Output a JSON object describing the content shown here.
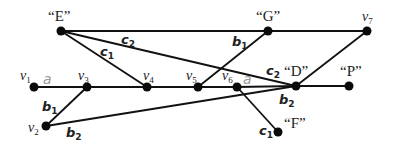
{
  "colors": {
    "edge": "#111111",
    "node": "#0a0a0a",
    "label": "#222222",
    "label_a": "#9a9a9a",
    "background": "#ffffff"
  },
  "nodes": [
    {
      "id": "E",
      "label": "“E”",
      "x": 61,
      "y": 31,
      "lx": 48,
      "ly": 21,
      "kind": "quoted"
    },
    {
      "id": "G",
      "label": "“G”",
      "x": 268,
      "y": 31,
      "lx": 256,
      "ly": 21,
      "kind": "quoted"
    },
    {
      "id": "v7",
      "base": "v",
      "sub": "7",
      "x": 367,
      "y": 31,
      "lx": 362,
      "ly": 21,
      "kind": "v"
    },
    {
      "id": "v1",
      "base": "v",
      "sub": "1",
      "x": 34,
      "y": 87,
      "lx": 20,
      "ly": 80,
      "kind": "v"
    },
    {
      "id": "v3",
      "base": "v",
      "sub": "3",
      "x": 87,
      "y": 87,
      "lx": 78,
      "ly": 80,
      "kind": "v"
    },
    {
      "id": "v4",
      "base": "v",
      "sub": "4",
      "x": 147,
      "y": 87,
      "lx": 143,
      "ly": 80,
      "kind": "v"
    },
    {
      "id": "v5",
      "base": "v",
      "sub": "5",
      "x": 198,
      "y": 87,
      "lx": 186,
      "ly": 80,
      "kind": "v"
    },
    {
      "id": "v6",
      "base": "v",
      "sub": "6",
      "x": 237,
      "y": 87,
      "lx": 222,
      "ly": 80,
      "kind": "v"
    },
    {
      "id": "D",
      "label": "“D”",
      "x": 296,
      "y": 86,
      "lx": 284,
      "ly": 76,
      "kind": "quoted"
    },
    {
      "id": "P",
      "label": "“P”",
      "x": 349,
      "y": 86,
      "lx": 340,
      "ly": 76,
      "kind": "quoted"
    },
    {
      "id": "v2",
      "base": "v",
      "sub": "2",
      "x": 46,
      "y": 126,
      "lx": 28,
      "ly": 132,
      "kind": "v"
    },
    {
      "id": "F",
      "label": "“F”",
      "x": 278,
      "y": 132,
      "lx": 284,
      "ly": 128,
      "kind": "quoted"
    }
  ],
  "edges": [
    {
      "from": "E",
      "to": "G"
    },
    {
      "from": "G",
      "to": "v7"
    },
    {
      "from": "E",
      "to": "D"
    },
    {
      "from": "E",
      "to": "v4"
    },
    {
      "from": "G",
      "to": "v5"
    },
    {
      "from": "v7",
      "to": "D"
    },
    {
      "from": "v1",
      "to": "v3"
    },
    {
      "from": "v3",
      "to": "v4"
    },
    {
      "from": "v4",
      "to": "v5"
    },
    {
      "from": "v5",
      "to": "v6"
    },
    {
      "from": "v6",
      "to": "D"
    },
    {
      "from": "D",
      "to": "P"
    },
    {
      "from": "v3",
      "to": "v2"
    },
    {
      "from": "v2",
      "to": "D"
    },
    {
      "from": "v6",
      "to": "F"
    }
  ],
  "edge_labels": [
    {
      "base": "c",
      "sub": "2",
      "x": 121,
      "y": 44,
      "kind": "bold"
    },
    {
      "base": "c",
      "sub": "1",
      "x": 100,
      "y": 56,
      "kind": "bold"
    },
    {
      "base": "b",
      "sub": "1",
      "x": 232,
      "y": 46,
      "kind": "bold"
    },
    {
      "base": "c",
      "sub": "2",
      "x": 266,
      "y": 75,
      "kind": "bold"
    },
    {
      "base": "a",
      "sub": "",
      "x": 43,
      "y": 84,
      "kind": "gray"
    },
    {
      "base": "a",
      "sub": "",
      "x": 243,
      "y": 84,
      "kind": "gray"
    },
    {
      "base": "b",
      "sub": "1",
      "x": 42,
      "y": 111,
      "kind": "bold"
    },
    {
      "base": "b",
      "sub": "2",
      "x": 66,
      "y": 137,
      "kind": "bold"
    },
    {
      "base": "b",
      "sub": "2",
      "x": 279,
      "y": 104,
      "kind": "bold"
    },
    {
      "base": "c",
      "sub": "1",
      "x": 259,
      "y": 135,
      "kind": "bold"
    }
  ]
}
